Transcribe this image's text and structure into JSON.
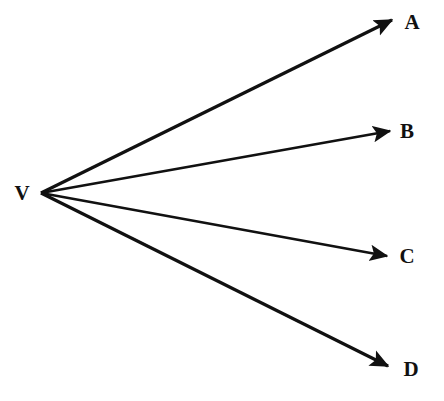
{
  "diagram": {
    "type": "vector-ray-diagram",
    "background_color": "#ffffff",
    "stroke_color": "#111111",
    "canvas": {
      "width": 444,
      "height": 401
    },
    "vertex": {
      "id": "V",
      "label": "V",
      "point": {
        "x": 41,
        "y": 193
      },
      "label_position": {
        "x": 22,
        "y": 193
      }
    },
    "rays": [
      {
        "id": "VA",
        "label": "A",
        "from": {
          "x": 41,
          "y": 193
        },
        "to": {
          "x": 392,
          "y": 20
        },
        "label_position": {
          "x": 412,
          "y": 22
        },
        "stroke_width": 3.2,
        "arrowhead": "solid-triangle"
      },
      {
        "id": "VB",
        "label": "B",
        "from": {
          "x": 41,
          "y": 193
        },
        "to": {
          "x": 390,
          "y": 131
        },
        "label_position": {
          "x": 407,
          "y": 131
        },
        "stroke_width": 2.6,
        "arrowhead": "solid-triangle"
      },
      {
        "id": "VC",
        "label": "C",
        "from": {
          "x": 41,
          "y": 193
        },
        "to": {
          "x": 387,
          "y": 256
        },
        "label_position": {
          "x": 407,
          "y": 256
        },
        "stroke_width": 2.6,
        "arrowhead": "solid-triangle"
      },
      {
        "id": "VD",
        "label": "D",
        "from": {
          "x": 41,
          "y": 193
        },
        "to": {
          "x": 388,
          "y": 366
        },
        "label_position": {
          "x": 411,
          "y": 369
        },
        "stroke_width": 3.2,
        "arrowhead": "solid-triangle"
      }
    ]
  }
}
